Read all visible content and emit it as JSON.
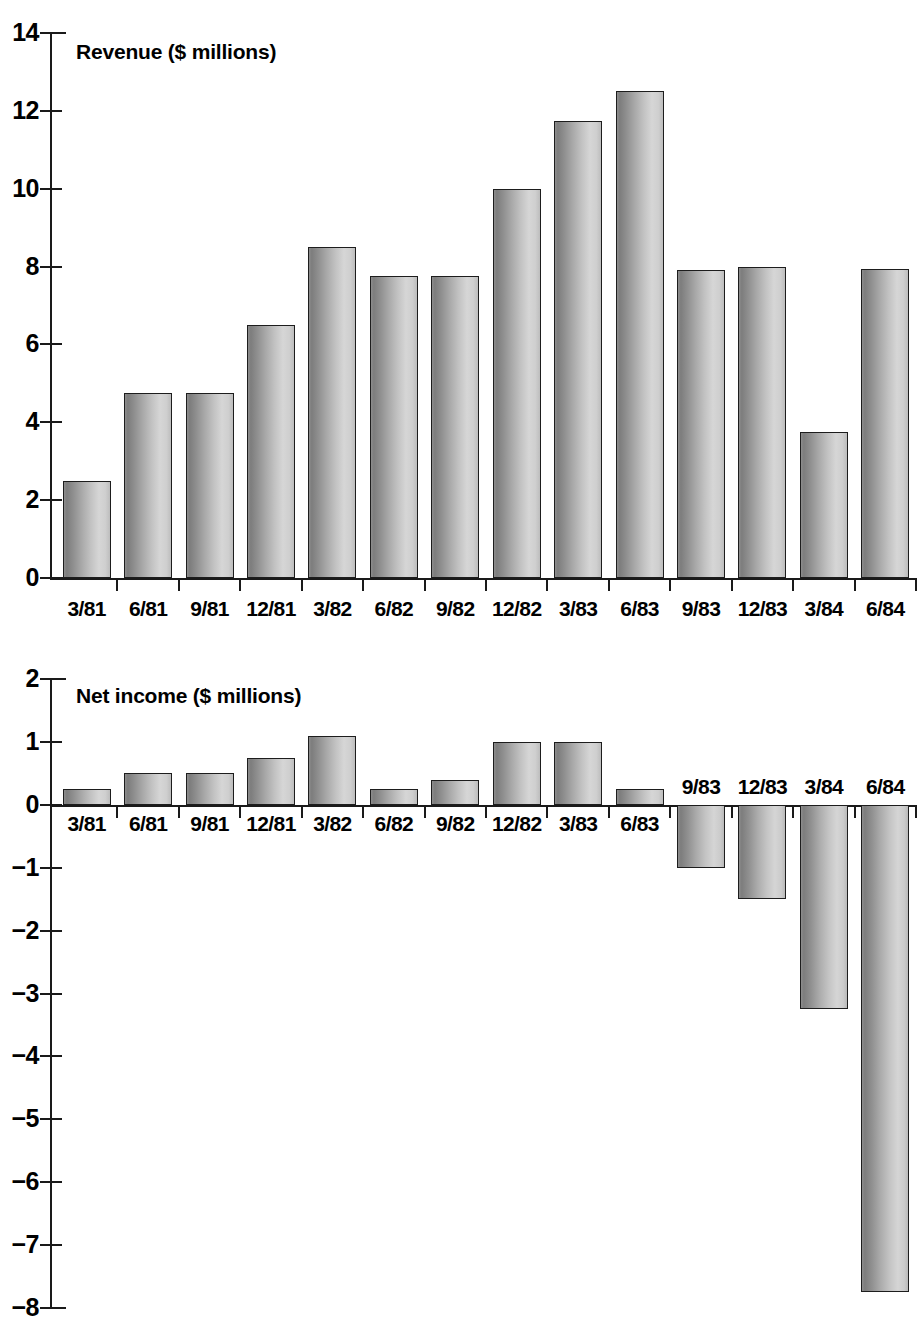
{
  "page": {
    "background": "#ffffff",
    "ink": "#1a1a1a",
    "bar_fill_light": "#d6d6d6",
    "bar_fill_dark": "#7d7d7d",
    "bar_outline": "#1d1d1d"
  },
  "chart_data": [
    {
      "type": "bar",
      "title": "Revenue ($ millions)",
      "xlabel": "",
      "ylabel": "",
      "ylim": [
        0,
        14
      ],
      "yticks": [
        0,
        2,
        4,
        6,
        8,
        10,
        12,
        14
      ],
      "ytick_labels": [
        "0",
        "2",
        "4",
        "6",
        "8",
        "10",
        "12",
        "14"
      ],
      "grid": false,
      "legend": "none",
      "categories": [
        "3/81",
        "6/81",
        "9/81",
        "12/81",
        "3/82",
        "6/82",
        "9/82",
        "12/82",
        "3/83",
        "6/83",
        "9/83",
        "12/83",
        "3/84",
        "6/84"
      ],
      "values": [
        2.5,
        4.75,
        4.75,
        6.5,
        8.5,
        7.75,
        7.75,
        10.0,
        11.75,
        12.5,
        7.9,
        8.0,
        3.75,
        7.95
      ]
    },
    {
      "type": "bar",
      "title": "Net income ($ millions)",
      "xlabel": "",
      "ylabel": "",
      "ylim": [
        -8,
        2
      ],
      "yticks": [
        2,
        1,
        0,
        -1,
        -2,
        -3,
        -4,
        -5,
        -6,
        -7,
        -8
      ],
      "ytick_labels": [
        "2",
        "1",
        "0",
        "−1",
        "−2",
        "−3",
        "−4",
        "−5",
        "−6",
        "−7",
        "−8"
      ],
      "grid": false,
      "legend": "none",
      "categories": [
        "3/81",
        "6/81",
        "9/81",
        "12/81",
        "3/82",
        "6/82",
        "9/82",
        "12/82",
        "3/83",
        "6/83",
        "9/83",
        "12/83",
        "3/84",
        "6/84"
      ],
      "values": [
        0.25,
        0.5,
        0.5,
        0.75,
        1.1,
        0.25,
        0.4,
        1.0,
        1.0,
        0.25,
        -1.0,
        -1.5,
        -3.25,
        -7.75
      ]
    }
  ]
}
